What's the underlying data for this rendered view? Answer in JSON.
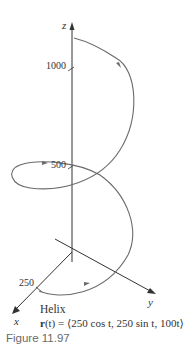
{
  "figure": {
    "caption": "Figure 11.97",
    "title": "Helix",
    "equation": {
      "lhs_bold": "r",
      "lhs_rest": "(t) = ",
      "rhs": "⟨250 cos t, 250 sin t, 100t⟩"
    },
    "axes": {
      "x_label": "x",
      "y_label": "y",
      "z_label": "z"
    },
    "ticks": {
      "z_1000": "1000",
      "z_500": "500",
      "x_250": "250"
    }
  },
  "colors": {
    "axis": "#333333",
    "curve": "#6b6b6b",
    "caption": "#6a6a6a"
  }
}
